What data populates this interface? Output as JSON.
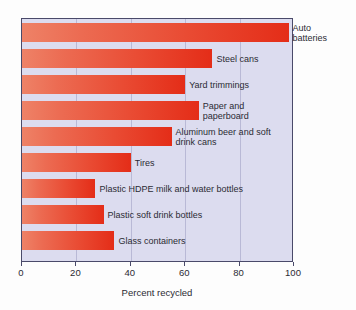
{
  "chart_data": {
    "type": "bar",
    "orientation": "horizontal",
    "title": "",
    "subtitle": "",
    "xlabel": "Percent recycled",
    "ylabel": "",
    "xlim": [
      0,
      100
    ],
    "xticks": [
      0,
      20,
      40,
      60,
      80,
      100
    ],
    "xtick_labels": [
      "0",
      "20",
      "40",
      "60",
      "80",
      "100"
    ],
    "grid": true,
    "grid_axis": "x",
    "legend": false,
    "legend_position": "none",
    "categories": [
      "Auto batteries",
      "Steel cans",
      "Yard trimmings",
      "Paper and paperboard",
      "Aluminum beer and soft drink cans",
      "Tires",
      "Plastic HDPE milk and water bottles",
      "Plastic soft drink bottles",
      "Glass containers"
    ],
    "values": [
      98,
      70,
      60,
      65,
      55,
      40,
      27,
      30,
      34
    ],
    "bars": [
      {
        "label_lines": [
          "Auto",
          "batteries"
        ],
        "value": 98,
        "label_outside": true
      },
      {
        "label_lines": [
          "Steel cans"
        ],
        "value": 70,
        "label_outside": false
      },
      {
        "label_lines": [
          "Yard trimmings"
        ],
        "value": 60,
        "label_outside": false
      },
      {
        "label_lines": [
          "Paper and",
          "paperboard"
        ],
        "value": 65,
        "label_outside": false
      },
      {
        "label_lines": [
          "Aluminum beer and soft",
          "drink cans"
        ],
        "value": 55,
        "label_outside": false
      },
      {
        "label_lines": [
          "Tires"
        ],
        "value": 40,
        "label_outside": false
      },
      {
        "label_lines": [
          "Plastic HDPE milk and water bottles"
        ],
        "value": 27,
        "label_outside": false
      },
      {
        "label_lines": [
          "Plastic soft drink bottles"
        ],
        "value": 30,
        "label_outside": false
      },
      {
        "label_lines": [
          "Glass containers"
        ],
        "value": 34,
        "label_outside": false
      }
    ],
    "colors": {
      "bar_light": "#ee8267",
      "bar_dark": "#e42d18",
      "plot_background": "#dcdcef",
      "grid": "#b9b9d6",
      "axis": "#4a4a6a",
      "text": "#2b2b33",
      "page_background": "#fdfdfd"
    }
  }
}
